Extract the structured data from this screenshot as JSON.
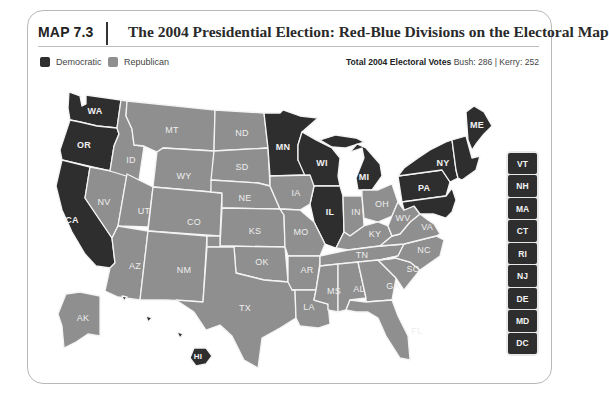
{
  "header": {
    "map_number": "MAP 7.3",
    "title": "The 2004 Presidential Election: Red-Blue Divisions on the Electoral Map"
  },
  "legend": {
    "items": [
      {
        "label": "Democratic",
        "color": "#2e2e2e"
      },
      {
        "label": "Republican",
        "color": "#8f8f8f"
      }
    ]
  },
  "totals": {
    "label": "Total 2004 Electoral Votes",
    "bush": "Bush: 286",
    "separator": "|",
    "kerry": "Kerry: 252"
  },
  "colors": {
    "democratic": "#2e2e2e",
    "republican": "#8f8f8f",
    "border": "#f4f4f4"
  },
  "states": {
    "democratic": [
      "WA",
      "OR",
      "CA",
      "MN",
      "WI",
      "MI",
      "IL",
      "PA",
      "NY",
      "ME",
      "HI",
      "VT",
      "NH",
      "MA",
      "CT",
      "RI",
      "NJ",
      "DE",
      "MD",
      "DC"
    ],
    "republican": [
      "MT",
      "ID",
      "WY",
      "ND",
      "SD",
      "NE",
      "KS",
      "OK",
      "TX",
      "NV",
      "UT",
      "CO",
      "AZ",
      "NM",
      "IA",
      "MO",
      "AR",
      "LA",
      "MS",
      "AL",
      "TN",
      "KY",
      "IN",
      "OH",
      "WV",
      "VA",
      "NC",
      "SC",
      "GA",
      "FL",
      "AK"
    ]
  },
  "labels": {
    "WA": "WA",
    "OR": "OR",
    "CA": "CA",
    "NV": "NV",
    "ID": "ID",
    "MT": "MT",
    "WY": "WY",
    "UT": "UT",
    "CO": "CO",
    "AZ": "AZ",
    "NM": "NM",
    "ND": "ND",
    "SD": "SD",
    "NE": "NE",
    "KS": "KS",
    "OK": "OK",
    "TX": "TX",
    "MN": "MN",
    "IA": "IA",
    "MO": "MO",
    "AR": "AR",
    "LA": "LA",
    "WI": "WI",
    "IL": "IL",
    "MI": "MI",
    "IN": "IN",
    "OH": "OH",
    "KY": "KY",
    "TN": "TN",
    "MS": "MS",
    "AL": "AL",
    "GA": "GA",
    "FL": "FL",
    "SC": "SC",
    "NC": "NC",
    "VA": "VA",
    "WV": "WV",
    "PA": "PA",
    "NY": "NY",
    "ME": "ME",
    "AK": "AK",
    "HI": "HI"
  },
  "small_states": [
    "VT",
    "NH",
    "MA",
    "CT",
    "RI",
    "NJ",
    "DE",
    "MD",
    "DC"
  ]
}
